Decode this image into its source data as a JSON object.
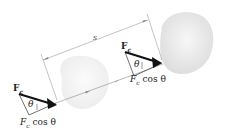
{
  "diagram": {
    "dimension_label": "s",
    "positions": [
      {
        "id": "initial",
        "force_label": "F",
        "force_subscript": "c",
        "angle_label": "θ",
        "component_label_main": "F",
        "component_subscript": "c",
        "component_suffix": " cos θ"
      },
      {
        "id": "final",
        "force_label": "F",
        "force_subscript": "c",
        "angle_label": "θ",
        "component_label_main": "F",
        "component_subscript": "c",
        "component_suffix": " cos θ"
      }
    ],
    "colors": {
      "body_fill": "#e8e8e8",
      "body_fill_faded": "#f3f3f3",
      "arrow": "#1a1a1a",
      "line": "#777777"
    }
  }
}
